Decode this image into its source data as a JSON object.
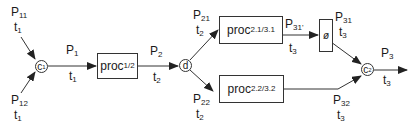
{
  "diagram": {
    "type": "process-flow",
    "inputs": [
      {
        "id": "p11",
        "label": "P",
        "sub": "11",
        "time": "t",
        "time_sub": "1"
      },
      {
        "id": "p12",
        "label": "P",
        "sub": "12",
        "time": "t",
        "time_sub": "1"
      }
    ],
    "nodes": {
      "c1": {
        "label": "c",
        "sub": "1"
      },
      "d": {
        "label": "d",
        "sub": ""
      },
      "c2": {
        "label": "c",
        "sub": "2"
      }
    },
    "processes": {
      "proc12": {
        "label": "proc",
        "sub": "1/2"
      },
      "proc2131": {
        "label": "proc",
        "sub": "2.1/3.1"
      },
      "phi": {
        "label": "ø"
      },
      "proc2232": {
        "label": "proc",
        "sub": "2.2/3.2"
      }
    },
    "edges": {
      "p1": {
        "label": "P",
        "sub": "1",
        "time": "t",
        "time_sub": "1"
      },
      "p2": {
        "label": "P",
        "sub": "2",
        "time": "t",
        "time_sub": "2"
      },
      "p21": {
        "label": "P",
        "sub": "21",
        "time": "t",
        "time_sub": "2"
      },
      "p22": {
        "label": "P",
        "sub": "22",
        "time": "t",
        "time_sub": "2"
      },
      "p31prime": {
        "label": "P",
        "sub": "31'",
        "time": "t",
        "time_sub": "3"
      },
      "p31": {
        "label": "P",
        "sub": "31",
        "time": "t",
        "time_sub": "3"
      },
      "p32": {
        "label": "P",
        "sub": "32",
        "time": "t",
        "time_sub": "3"
      },
      "p3": {
        "label": "P",
        "sub": "3",
        "time": "t",
        "time_sub": "3"
      }
    },
    "colors": {
      "stroke": "#333333",
      "text": "#1a1a1a",
      "background": "#ffffff"
    }
  }
}
